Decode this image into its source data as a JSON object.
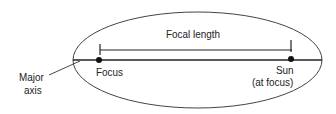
{
  "diagram": {
    "labels": {
      "focal_length": "Focal length",
      "focus": "Focus",
      "sun_line1": "Sun",
      "sun_line2": "(at focus)",
      "major_line1": "Major",
      "major_line2": "axis"
    },
    "colors": {
      "stroke": "#333333",
      "text": "#222222",
      "background": "#ffffff"
    }
  }
}
